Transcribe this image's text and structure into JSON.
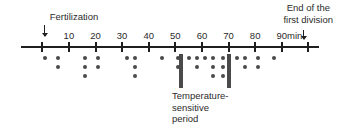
{
  "figure": {
    "width": 339,
    "height": 137,
    "background": "#ffffff",
    "ink_color": "#1f1f1f",
    "marker_color": "#4a4a4a"
  },
  "annotations": {
    "fertilization_label": "Fertilization",
    "end_of_division_line1": "End of the",
    "end_of_division_line2": "first division",
    "units_label": "min",
    "ts_period_line1": "Temperature-",
    "ts_period_line2": "sensitive",
    "ts_period_line3": "period"
  },
  "chart_data": {
    "type": "scatter",
    "title": "",
    "xlabel": "",
    "ylabel": "",
    "xlim": [
      -8,
      104
    ],
    "grid": false,
    "legend": null,
    "tick_labels": [
      "10",
      "20",
      "30",
      "40",
      "50",
      "60",
      "70",
      "80",
      "90"
    ],
    "tick_values": [
      10,
      20,
      30,
      40,
      50,
      60,
      70,
      80,
      90
    ],
    "event_markers": [
      {
        "name": "fertilization",
        "x": 0,
        "label": "Fertilization"
      },
      {
        "name": "end-of-first-division",
        "x": 100,
        "label": "End of the first division"
      }
    ],
    "temperature_sensitive_period": {
      "start": 52,
      "end": 70
    },
    "stacks": [
      {
        "x": 1,
        "count": 1
      },
      {
        "x": 6,
        "count": 2
      },
      {
        "x": 16,
        "count": 3
      },
      {
        "x": 21,
        "count": 2
      },
      {
        "x": 32,
        "count": 1
      },
      {
        "x": 35,
        "count": 3
      },
      {
        "x": 45,
        "count": 1
      },
      {
        "x": 51,
        "count": 2
      },
      {
        "x": 55,
        "count": 1
      },
      {
        "x": 58,
        "count": 2
      },
      {
        "x": 61,
        "count": 1
      },
      {
        "x": 64,
        "count": 3
      },
      {
        "x": 68,
        "count": 3
      },
      {
        "x": 73,
        "count": 1
      },
      {
        "x": 76,
        "count": 2
      },
      {
        "x": 81,
        "count": 2
      },
      {
        "x": 87,
        "count": 1
      }
    ]
  }
}
